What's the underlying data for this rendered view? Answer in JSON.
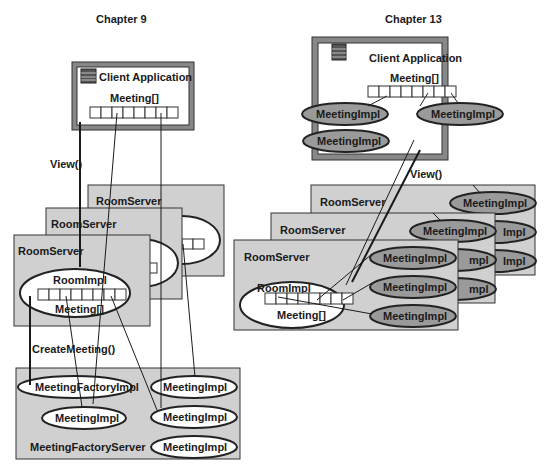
{
  "left": {
    "title": "Chapter 9",
    "client": {
      "label": "Client Application",
      "array_label": "Meeting[]"
    },
    "view_label": "View()",
    "room_servers": [
      "RoomServer",
      "RoomServer",
      "RoomServer"
    ],
    "room_impl": {
      "label": "RoomImpl",
      "array_label": "Meeting[]"
    },
    "create_label": "CreateMeeting()",
    "factory_server": {
      "label": "MeetingFactoryServer",
      "factory_impl": "MeetingFactoryImpl",
      "meetings": [
        "MeetingImpl",
        "MeetingImpl",
        "MeetingImpl",
        "MeetingImpl"
      ]
    }
  },
  "right": {
    "title": "Chapter 13",
    "client": {
      "label": "Client Application",
      "array_label": "Meeting[]",
      "meetings": [
        "MeetingImpl",
        "MeetingImpl",
        "MeetingImpl"
      ]
    },
    "view_label": "View()",
    "room_servers": [
      "RoomServer",
      "RoomServer",
      "RoomServer"
    ],
    "room_impl": {
      "label": "RoomImpl",
      "array_label": "Meeting[]"
    },
    "meetings_front": [
      "MeetingImpl",
      "MeetingImpl",
      "MeetingImpl"
    ],
    "meetings_back": [
      "MeetingImpl",
      "Impl",
      "Impl",
      "Impl",
      "mpl",
      "mpl"
    ]
  },
  "colors": {
    "server_fill": "#d0d0d0",
    "meeting_fill": "#9a9a9a",
    "line": "#1a1a1a"
  }
}
